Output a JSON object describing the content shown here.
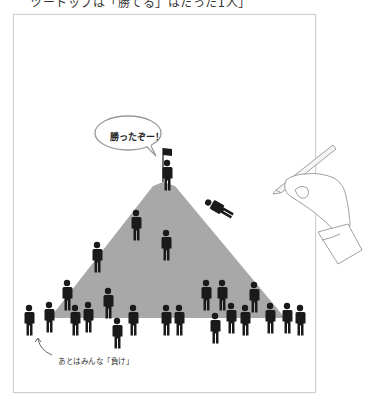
{
  "header": {
    "caption": "ツートップは「勝てる」はたった1人」"
  },
  "illustration": {
    "speech_bubble": "勝ったぞー！",
    "bottom_caption": "あとはみんな「負け」",
    "mountain_color": "#a8a8a8",
    "figure_color": "#1a1a1a"
  }
}
